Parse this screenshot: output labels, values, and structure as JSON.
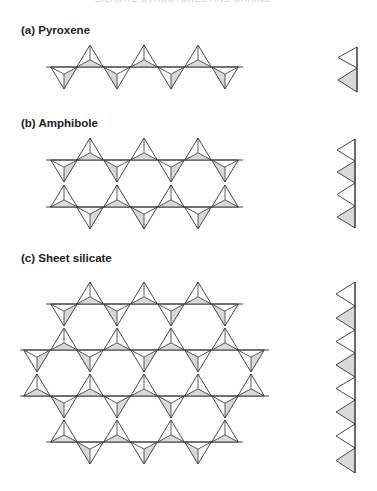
{
  "header": {
    "text": "SILICATE STRUCTURES AND CHAINS"
  },
  "labels": {
    "pyroxene": "(a) Pyroxene",
    "amphibole": "(b) Amphibole",
    "sheet": "(c) Sheet silicate"
  },
  "colors": {
    "stroke": "#333333",
    "shade": "#d9d9d9",
    "background": "#ffffff"
  },
  "geometry": {
    "half_width": 13.3,
    "apex_height": 22,
    "inner_height": 13
  },
  "pyroxene": {
    "lines": [
      {
        "y": 67,
        "x1": 46,
        "x2": 243
      }
    ],
    "down": [
      {
        "cx": 64,
        "y": 67
      },
      {
        "cx": 117,
        "y": 67
      },
      {
        "cx": 171,
        "y": 67
      },
      {
        "cx": 225,
        "y": 67
      }
    ],
    "up": [
      {
        "cx": 90,
        "y": 67
      },
      {
        "cx": 144,
        "y": 67
      },
      {
        "cx": 198,
        "y": 67
      }
    ],
    "side": {
      "x": 357,
      "apex_x": 338,
      "y0": 47,
      "segments": [
        {
          "h": 21,
          "shaded": false
        },
        {
          "h": 24,
          "shaded": true
        }
      ]
    }
  },
  "amphibole": {
    "lines": [
      {
        "y": 160,
        "x1": 46,
        "x2": 243
      },
      {
        "y": 207,
        "x1": 46,
        "x2": 243
      }
    ],
    "up": [
      {
        "cx": 90,
        "y": 160
      },
      {
        "cx": 144,
        "y": 160
      },
      {
        "cx": 198,
        "y": 160
      },
      {
        "cx": 64,
        "y": 207
      },
      {
        "cx": 117,
        "y": 207
      },
      {
        "cx": 171,
        "y": 207
      },
      {
        "cx": 225,
        "y": 207
      }
    ],
    "down": [
      {
        "cx": 64,
        "y": 160
      },
      {
        "cx": 117,
        "y": 160
      },
      {
        "cx": 171,
        "y": 160
      },
      {
        "cx": 225,
        "y": 160
      },
      {
        "cx": 90,
        "y": 207
      },
      {
        "cx": 144,
        "y": 207
      },
      {
        "cx": 198,
        "y": 207
      }
    ],
    "side": {
      "x": 355,
      "apex_x": 337,
      "y0": 139,
      "segments": [
        {
          "h": 22,
          "shaded": false
        },
        {
          "h": 22,
          "shaded": true
        },
        {
          "h": 23,
          "shaded": false
        },
        {
          "h": 22,
          "shaded": true
        }
      ]
    }
  },
  "sheet": {
    "lines": [
      {
        "y": 304,
        "x1": 46,
        "x2": 243
      },
      {
        "y": 350,
        "x1": 20,
        "x2": 269
      },
      {
        "y": 396,
        "x1": 20,
        "x2": 269
      },
      {
        "y": 442,
        "x1": 46,
        "x2": 243
      }
    ],
    "up": [
      {
        "cx": 90,
        "y": 304
      },
      {
        "cx": 144,
        "y": 304
      },
      {
        "cx": 198,
        "y": 304
      },
      {
        "cx": 64,
        "y": 350
      },
      {
        "cx": 117,
        "y": 350
      },
      {
        "cx": 171,
        "y": 350
      },
      {
        "cx": 225,
        "y": 350
      },
      {
        "cx": 37,
        "y": 396
      },
      {
        "cx": 90,
        "y": 396
      },
      {
        "cx": 144,
        "y": 396
      },
      {
        "cx": 198,
        "y": 396
      },
      {
        "cx": 251,
        "y": 396
      },
      {
        "cx": 64,
        "y": 442
      },
      {
        "cx": 117,
        "y": 442
      },
      {
        "cx": 171,
        "y": 442
      },
      {
        "cx": 225,
        "y": 442
      }
    ],
    "down": [
      {
        "cx": 64,
        "y": 304
      },
      {
        "cx": 117,
        "y": 304
      },
      {
        "cx": 171,
        "y": 304
      },
      {
        "cx": 225,
        "y": 304
      },
      {
        "cx": 37,
        "y": 350
      },
      {
        "cx": 90,
        "y": 350
      },
      {
        "cx": 144,
        "y": 350
      },
      {
        "cx": 198,
        "y": 350
      },
      {
        "cx": 251,
        "y": 350
      },
      {
        "cx": 64,
        "y": 396
      },
      {
        "cx": 117,
        "y": 396
      },
      {
        "cx": 171,
        "y": 396
      },
      {
        "cx": 225,
        "y": 396
      },
      {
        "cx": 90,
        "y": 442
      },
      {
        "cx": 144,
        "y": 442
      },
      {
        "cx": 198,
        "y": 442
      }
    ],
    "side": {
      "x": 355,
      "apex_x": 336,
      "y0": 282,
      "segments": [
        {
          "h": 24,
          "shaded": false
        },
        {
          "h": 24,
          "shaded": true
        },
        {
          "h": 23,
          "shaded": false
        },
        {
          "h": 24,
          "shaded": true
        },
        {
          "h": 23,
          "shaded": false
        },
        {
          "h": 24,
          "shaded": true
        },
        {
          "h": 24,
          "shaded": false
        },
        {
          "h": 25,
          "shaded": true
        }
      ]
    }
  }
}
